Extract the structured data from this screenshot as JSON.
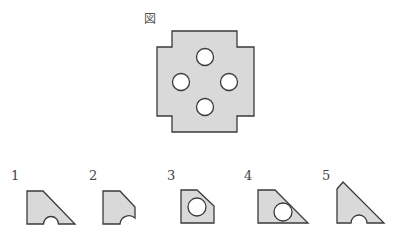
{
  "figure": {
    "label": "図",
    "fill": "#d9d9d9",
    "stroke": "#3a3a3a"
  },
  "options": [
    {
      "number": "1",
      "description": "trapezoid piece with semicircular notch on bottom edge"
    },
    {
      "number": "2",
      "description": "piece with cut corner and notch at bottom-right corner"
    },
    {
      "number": "3",
      "description": "piece with cut corner and full circular hole"
    },
    {
      "number": "4",
      "description": "trapezoid piece with full circular hole"
    },
    {
      "number": "5",
      "description": "triangular piece with semicircular notch on bottom edge"
    }
  ]
}
